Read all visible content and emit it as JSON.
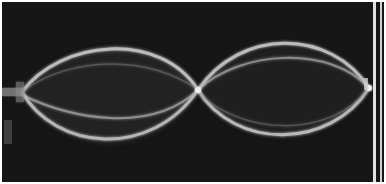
{
  "image": {
    "description": "Photograph of a vibrating string showing a standing wave with two antinode loops (second harmonic)",
    "subject": "standing-wave",
    "loops": 2,
    "nodes": 3,
    "colors": {
      "background": "#161616",
      "string_glow": "#e6e6e6",
      "border": "#ffffff"
    }
  }
}
